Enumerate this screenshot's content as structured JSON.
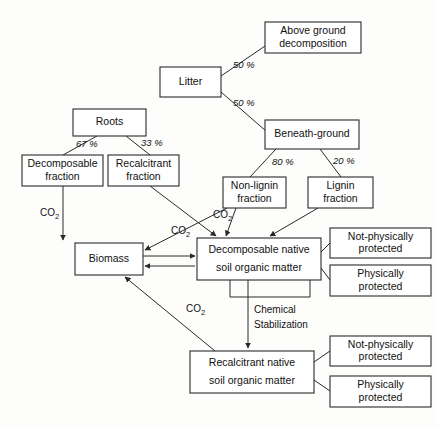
{
  "diagram": {
    "co2_label": "CO",
    "co2_sub": "2",
    "nodes": [
      {
        "id": "above-ground-decomposition",
        "line1": "Above    ground",
        "line2": "decomposition",
        "x": 265,
        "y": 22,
        "w": 96,
        "h": 31
      },
      {
        "id": "litter",
        "line1": "Litter",
        "line2": "",
        "x": 160,
        "y": 67,
        "w": 61,
        "h": 30
      },
      {
        "id": "beneath-ground",
        "line1": "Beneath-ground",
        "line2": "",
        "x": 265,
        "y": 120,
        "w": 94,
        "h": 29
      },
      {
        "id": "roots",
        "line1": "Roots",
        "line2": "",
        "x": 73,
        "y": 109,
        "w": 73,
        "h": 27
      },
      {
        "id": "decomposable-fraction",
        "line1": "Decomposable",
        "line2": "fraction",
        "x": 22,
        "y": 155,
        "w": 81,
        "h": 31
      },
      {
        "id": "recalcitrant-fraction",
        "line1": "Recalcitrant",
        "line2": "fraction",
        "x": 108,
        "y": 155,
        "w": 71,
        "h": 31
      },
      {
        "id": "non-lignin-fraction",
        "line1": "Non-lignin",
        "line2": "fraction",
        "x": 223,
        "y": 177,
        "w": 63,
        "h": 31
      },
      {
        "id": "lignin-fraction",
        "line1": "Lignin",
        "line2": "fraction",
        "x": 308,
        "y": 177,
        "w": 65,
        "h": 31
      },
      {
        "id": "biomass",
        "line1": "Biomass",
        "line2": "",
        "x": 75,
        "y": 243,
        "w": 68,
        "h": 32
      },
      {
        "id": "decomposable-native-som",
        "line1": "Decomposable   native",
        "line2": "soil  organic  matter",
        "x": 197,
        "y": 238,
        "w": 124,
        "h": 42
      },
      {
        "id": "not-physically-protected-top",
        "line1": "Not-physically",
        "line2": "protected",
        "x": 330,
        "y": 228,
        "w": 101,
        "h": 30
      },
      {
        "id": "physically-protected-top",
        "line1": "Physically",
        "line2": "protected",
        "x": 330,
        "y": 265,
        "w": 101,
        "h": 31
      },
      {
        "id": "recalcitrant-native-som",
        "line1": "Recalcitrant   native",
        "line2": "soil  organic  matter",
        "x": 190,
        "y": 351,
        "w": 124,
        "h": 42
      },
      {
        "id": "not-physically-protected-bottom",
        "line1": "Not-physically",
        "line2": "protected",
        "x": 330,
        "y": 336,
        "w": 101,
        "h": 30
      },
      {
        "id": "physically-protected-bottom",
        "line1": "Physically",
        "line2": "protected",
        "x": 330,
        "y": 376,
        "w": 101,
        "h": 31
      }
    ],
    "edge_labels": [
      {
        "id": "litter-to-above-ground",
        "text": "50 %",
        "x": 233,
        "y": 68
      },
      {
        "id": "litter-to-beneath-ground",
        "text": "50 %",
        "x": 233,
        "y": 106
      },
      {
        "id": "beneath-to-non-lignin",
        "text": "80 %",
        "x": 272,
        "y": 165
      },
      {
        "id": "beneath-to-lignin",
        "text": "20 %",
        "x": 333,
        "y": 164
      },
      {
        "id": "roots-to-decomposable",
        "text": "67 %",
        "x": 76,
        "y": 147
      },
      {
        "id": "roots-to-recalcitrant",
        "text": "33 %",
        "x": 141,
        "y": 146
      }
    ],
    "co2_labels": [
      {
        "id": "co2-decomposable-fraction",
        "x": 40,
        "y": 216
      },
      {
        "id": "co2-non-lignin",
        "x": 213,
        "y": 218
      },
      {
        "id": "co2-recalcitrant-fraction",
        "x": 171,
        "y": 234
      },
      {
        "id": "co2-recalcitrant-som",
        "x": 186,
        "y": 312
      }
    ],
    "chemical_stabilization": {
      "id": "chemical-stabilization-label",
      "line1": "Chemical",
      "line2": "Stabilization",
      "x": 254,
      "y": 313
    },
    "colors": {
      "stroke": "#2a2a2a",
      "text": "#111111",
      "background": "#fdfdfc",
      "node_fill": "#ffffff"
    }
  }
}
